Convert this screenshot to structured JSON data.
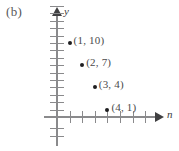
{
  "figure": {
    "part_label": "(b)",
    "axis_y_label": "y",
    "axis_x_label": "n"
  },
  "chart_data": {
    "type": "scatter",
    "title": "(b)",
    "xlabel": "n",
    "ylabel": "y",
    "grid": false,
    "legend": null,
    "xlim": [
      -1,
      8
    ],
    "ylim": [
      -2,
      14
    ],
    "x_tick_count": 7,
    "y_tick_count": 15,
    "x_tick_labels": [],
    "y_tick_labels": [],
    "points": [
      {
        "x": 1,
        "y": 10,
        "label": "(1, 10)"
      },
      {
        "x": 2,
        "y": 7,
        "label": "(2, 7)"
      },
      {
        "x": 3,
        "y": 4,
        "label": "(3, 4)"
      },
      {
        "x": 4,
        "y": 1,
        "label": "(4, 1)"
      }
    ],
    "point_color": "#1e1e20",
    "axis_color": "#8a8a8c"
  }
}
